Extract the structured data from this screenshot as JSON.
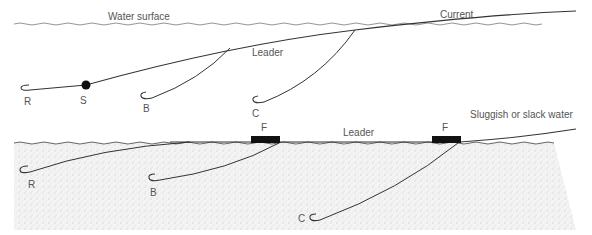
{
  "top_diagram": {
    "labels": {
      "water_surface": "Water surface",
      "current": "Current",
      "leader": "Leader",
      "R": "R",
      "S": "S",
      "B": "B",
      "C": "C"
    }
  },
  "bottom_diagram": {
    "labels": {
      "sluggish": "Sluggish or slack water",
      "leader": "Leader",
      "F1": "F",
      "F2": "F",
      "R": "R",
      "B": "B",
      "C": "C"
    }
  },
  "colors": {
    "line": "#333333",
    "surface_line": "#888888",
    "text": "#555555",
    "float": "#111111",
    "stipple": "#bdbdbd"
  }
}
